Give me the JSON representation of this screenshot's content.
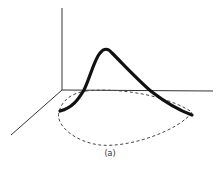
{
  "figure": {
    "caption": "(a)",
    "colors": {
      "axis": "#333333",
      "curve": "#111111",
      "projection": "#444444",
      "background": "#ffffff"
    },
    "axes": {
      "vertical": {
        "from": [
          62,
          8
        ],
        "to": [
          62,
          90
        ]
      },
      "horizontal": {
        "from": [
          62,
          90
        ],
        "to": [
          213,
          91
        ]
      },
      "depth": {
        "from": [
          62,
          90
        ],
        "to": [
          11,
          135
        ]
      }
    },
    "curve_description": "thick 3D curve rising to a peak above the base plane",
    "projection_description": "dashed closed loop projected onto base plane"
  }
}
